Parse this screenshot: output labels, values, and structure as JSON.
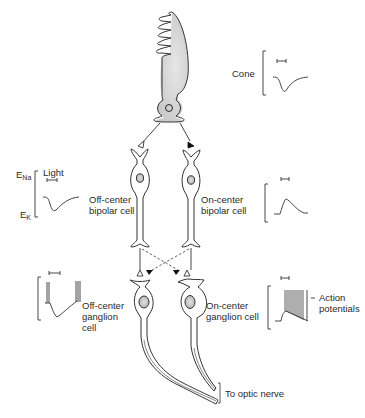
{
  "diagram": {
    "type": "retinal-circuit-schematic",
    "colors": {
      "ink": "#333333",
      "stipple": "#bbbbbb",
      "background": "#ffffff"
    },
    "cells": {
      "cone": {
        "label": "Cone"
      },
      "off_bipolar": {
        "label": "Off-center\nbipolar cell"
      },
      "on_bipolar": {
        "label": "On-center\nbipolar cell"
      },
      "off_ganglion": {
        "label": "Off-center\nganglion\ncell"
      },
      "on_ganglion": {
        "label": "On-center\nganglion cell"
      }
    },
    "traces": {
      "legend": {
        "top": "ENa",
        "top_base": "E",
        "top_sub": "Na",
        "bottom_base": "E",
        "bottom_sub": "K",
        "stimulus": "Light"
      },
      "action_potentials_label": "Action\npotentials"
    },
    "synapses": {
      "cone_to_off_bipolar": "open-triangle (sign-conserving)",
      "cone_to_on_bipolar": "filled-triangle (sign-inverting)",
      "off_bipolar_to_off_ganglion": "open-triangle",
      "on_bipolar_to_on_ganglion": "open-triangle",
      "crossed_inhibitory": "filled-triangle, dashed"
    },
    "output_label": "To optic nerve"
  }
}
